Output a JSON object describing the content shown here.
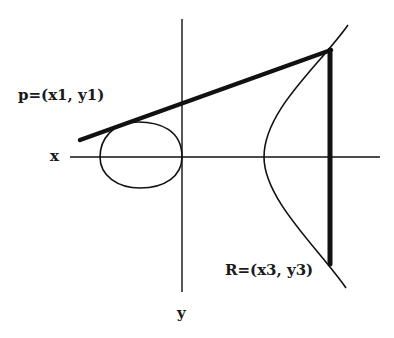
{
  "diagram": {
    "labels": {
      "point_p": "p=(x1, y1)",
      "point_r": "R=(x3, y3)",
      "x_axis": "x",
      "y_axis": "y"
    },
    "colors": {
      "stroke": "#111111",
      "background": "#ffffff"
    },
    "elements": {
      "x_axis": {
        "x1": 70,
        "y1": 157,
        "x2": 380,
        "y2": 157
      },
      "y_axis": {
        "x1": 182,
        "y1": 19,
        "x2": 182,
        "y2": 292
      },
      "secant_line": {
        "x1": 80,
        "y1": 140,
        "x2": 331,
        "y2": 50
      },
      "vertical_line": {
        "x1": 330,
        "y1": 50,
        "x2": 330,
        "y2": 264
      }
    }
  }
}
